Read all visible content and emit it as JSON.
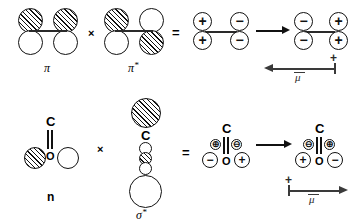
{
  "figure": {
    "rows": [
      {
        "id": "pi-pi-star-row",
        "operand_left_label": "π",
        "operator_multiply": "×",
        "operand_right_label": "π",
        "operand_right_star": "*",
        "operator_equals": "=",
        "product_left": {
          "left_top": "+",
          "left_bottom": "+",
          "right_top": "−",
          "right_bottom": "−"
        },
        "product_right": {
          "left_top": "−",
          "left_bottom": "−",
          "right_top": "+",
          "right_bottom": "+"
        },
        "dipole": {
          "direction": "left",
          "sign_label": "+",
          "symbol": "μ"
        }
      },
      {
        "id": "n-sigma-star-row",
        "operand_left_label": "n",
        "operator_multiply": "×",
        "operand_right_label": "σ",
        "operand_right_star": "*",
        "operator_equals": "=",
        "carbon_label": "C",
        "oxygen_label": "O",
        "product_left": {
          "inner_left": "⊕",
          "inner_right": "⊖",
          "outer_left": "−",
          "outer_right": "+",
          "carbon_label": "C",
          "oxygen_label": "O"
        },
        "product_right": {
          "inner_left": "⊖",
          "inner_right": "⊕",
          "outer_left": "+",
          "outer_right": "−",
          "carbon_label": "C",
          "oxygen_label": "O"
        },
        "dipole": {
          "direction": "right",
          "sign_label": "+",
          "symbol": "μ"
        }
      }
    ],
    "colors": {
      "ink": "#111111",
      "hatch": "#111111",
      "arrow": "#3a3a3a",
      "background": "#ffffff"
    }
  }
}
